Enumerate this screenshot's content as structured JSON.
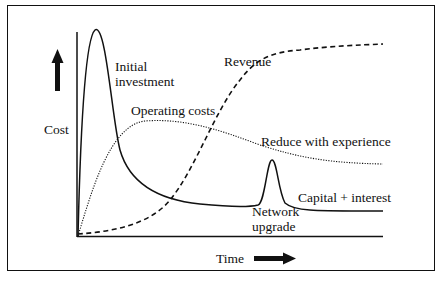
{
  "diagram": {
    "title": "",
    "axes": {
      "y_label": "Cost",
      "x_label": "Time",
      "y_arrow": "up-arrow-icon",
      "x_arrow": "right-arrow-icon"
    },
    "curves": [
      {
        "id": "capital",
        "name": "Capital + interest",
        "style": "solid"
      },
      {
        "id": "operating",
        "name": "Operating costs",
        "style": "dotted"
      },
      {
        "id": "revenue",
        "name": "Revenue",
        "style": "dashed"
      }
    ],
    "annotations": {
      "initial_investment_line1": "Initial",
      "initial_investment_line2": "investment",
      "operating_costs": "Operating costs",
      "revenue": "Revenue",
      "reduce_with_experience": "Reduce with experience",
      "capital_interest": "Capital + interest",
      "network_upgrade_line1": "Network",
      "network_upgrade_line2": "upgrade"
    },
    "colors": {
      "ink": "#111111",
      "background": "#ffffff"
    }
  }
}
